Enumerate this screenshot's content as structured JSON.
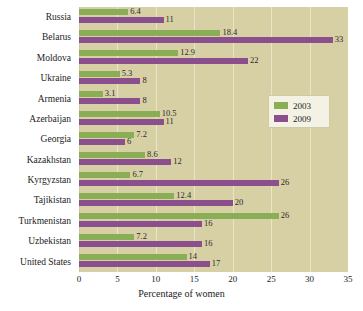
{
  "chart_data": {
    "type": "bar",
    "orientation": "horizontal",
    "title": "",
    "xlabel": "Percentage of women",
    "ylabel": "",
    "xlim": [
      0,
      35
    ],
    "xticks": [
      0,
      5,
      10,
      15,
      20,
      25,
      30,
      35
    ],
    "grid": true,
    "legend_position": "right-middle",
    "categories": [
      "Russia",
      "Belarus",
      "Moldova",
      "Ukraine",
      "Armenia",
      "Azerbaijan",
      "Georgia",
      "Kazakhstan",
      "Kyrgyzstan",
      "Tajikistan",
      "Turkmenistan",
      "Uzbekistan",
      "United States"
    ],
    "series": [
      {
        "name": "2003",
        "color": "#8aae55",
        "values": [
          6.4,
          18.4,
          12.9,
          5.3,
          3.1,
          10.5,
          7.2,
          8.6,
          6.7,
          12.4,
          26,
          7.2,
          14
        ],
        "labels": [
          "6.4",
          "18.4",
          "12.9",
          "5.3",
          "3.1",
          "10.5",
          "7.2",
          "8.6",
          "6.7",
          "12.4",
          "26",
          "7.2",
          "14"
        ]
      },
      {
        "name": "2009",
        "color": "#8c4f8e",
        "values": [
          11,
          33,
          22,
          8,
          8,
          11,
          6,
          12,
          26,
          20,
          16,
          16,
          17
        ],
        "labels": [
          "11",
          "33",
          "22",
          "8",
          "8",
          "11",
          "6",
          "12",
          "26",
          "20",
          "16",
          "16",
          "17"
        ]
      }
    ]
  },
  "legend": {
    "items": [
      {
        "label": "2003"
      },
      {
        "label": "2009"
      }
    ]
  },
  "axis": {
    "x_title": "Percentage of women",
    "tick_labels": [
      "0",
      "5",
      "10",
      "15",
      "20",
      "25",
      "30",
      "35"
    ]
  }
}
